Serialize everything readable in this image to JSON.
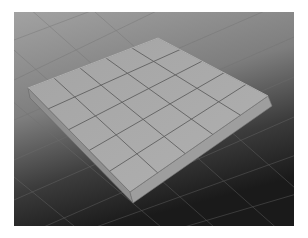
{
  "viewport": {
    "label": "3D perspective viewport",
    "background_top": "#9a9a9a",
    "background_bottom": "#1e1e1e"
  },
  "object": {
    "name": "polygon slab",
    "subdivisions_width": 5,
    "subdivisions_depth": 5,
    "top_color": "#a9a9a9",
    "front_side_color": "#9d9d9d",
    "left_side_color": "#8c8c8c",
    "edge_color": "#555555"
  },
  "floor_grid": {
    "line_color": "#6f6f6f"
  }
}
